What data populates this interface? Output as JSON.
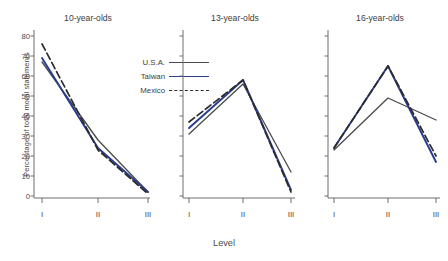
{
  "chart_data": {
    "type": "line",
    "title": "",
    "xlabel": "Level",
    "ylabel": "Percentage of total moral statements",
    "categories": [
      "I",
      "II",
      "III"
    ],
    "ylim": [
      0,
      82
    ],
    "yticks": [
      0,
      10,
      20,
      30,
      40,
      50,
      60,
      70,
      80
    ],
    "ytick_labels": [
      "0",
      "10",
      "20",
      "30",
      "40",
      "50",
      "60",
      "70",
      "80"
    ],
    "grid": false,
    "legend_position": "inside-panel-1-top-right",
    "legend": [
      {
        "name": "U.S.A.",
        "color": "#4a4a4a",
        "style": "solid"
      },
      {
        "name": "Taiwan",
        "color": "#2a3c8f",
        "style": "solid"
      },
      {
        "name": "Mexico",
        "color": "#2b2b2b",
        "style": "dashed"
      }
    ],
    "panels": [
      {
        "title": "10-year-olds",
        "series": [
          {
            "name": "U.S.A.",
            "color": "#4a4a4a",
            "style": "solid",
            "values": [
              67,
              28,
              2
            ]
          },
          {
            "name": "Taiwan",
            "color": "#2a3c8f",
            "style": "solid",
            "values": [
              69,
              24,
              2
            ]
          },
          {
            "name": "Mexico",
            "color": "#2b2b2b",
            "style": "dashed",
            "values": [
              76,
              23,
              1
            ]
          }
        ]
      },
      {
        "title": "13-year-olds",
        "series": [
          {
            "name": "U.S.A.",
            "color": "#4a4a4a",
            "style": "solid",
            "values": [
              31,
              56,
              12
            ]
          },
          {
            "name": "Taiwan",
            "color": "#2a3c8f",
            "style": "solid",
            "values": [
              34,
              58,
              3
            ]
          },
          {
            "name": "Mexico",
            "color": "#2b2b2b",
            "style": "dashed",
            "values": [
              37,
              58,
              2
            ]
          }
        ]
      },
      {
        "title": "16-year-olds",
        "series": [
          {
            "name": "U.S.A.",
            "color": "#4a4a4a",
            "style": "solid",
            "values": [
              23,
              49,
              38
            ]
          },
          {
            "name": "Taiwan",
            "color": "#2a3c8f",
            "style": "solid",
            "values": [
              24,
              65,
              17
            ]
          },
          {
            "name": "Mexico",
            "color": "#2b2b2b",
            "style": "dashed",
            "values": [
              24,
              65,
              20
            ]
          }
        ]
      }
    ]
  },
  "axis": {
    "ylabel": "Percentage of total moral statements",
    "xlabel": "Level",
    "ytick_labels": [
      "80",
      "70",
      "60",
      "50",
      "40",
      "30",
      "20",
      "10",
      "0"
    ],
    "xtick_labels": [
      "I",
      "II",
      "III"
    ]
  },
  "panels": {
    "p1_title": "10-year-olds",
    "p2_title": "13-year-olds",
    "p3_title": "16-year-olds"
  },
  "legend": {
    "usa": "U.S.A.",
    "taiwan": "Taiwan",
    "mexico": "Mexico"
  }
}
